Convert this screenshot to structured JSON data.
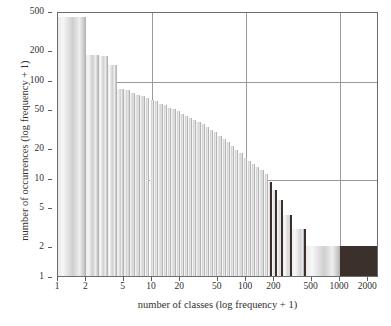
{
  "chart_data": {
    "type": "bar",
    "title": "",
    "subtitle": "",
    "xlabel": "number of classes (log frequency + 1)",
    "ylabel": "number of occurrences (log frequency + 1)",
    "xscale": "log",
    "yscale": "log",
    "xlim": [
      1,
      2600
    ],
    "ylim": [
      1,
      500
    ],
    "grid": true,
    "legend": null,
    "annotations": [],
    "x_ticks": [
      {
        "value": 1,
        "label": "1"
      },
      {
        "value": 2,
        "label": "2"
      },
      {
        "value": 5,
        "label": "5"
      },
      {
        "value": 10,
        "label": "10"
      },
      {
        "value": 20,
        "label": "20"
      },
      {
        "value": 50,
        "label": "50"
      },
      {
        "value": 100,
        "label": "100"
      },
      {
        "value": 200,
        "label": "200"
      },
      {
        "value": 500,
        "label": "500"
      },
      {
        "value": 1000,
        "label": "1000"
      },
      {
        "value": 2000,
        "label": "2000"
      }
    ],
    "y_ticks": [
      {
        "value": 1,
        "label": "1"
      },
      {
        "value": 2,
        "label": "2"
      },
      {
        "value": 5,
        "label": "5"
      },
      {
        "value": 10,
        "label": "10"
      },
      {
        "value": 20,
        "label": "20"
      },
      {
        "value": 50,
        "label": "50"
      },
      {
        "value": 100,
        "label": "100"
      },
      {
        "value": 200,
        "label": "200"
      },
      {
        "value": 500,
        "label": "500"
      }
    ],
    "gridlines": {
      "horizontal_values": [
        10,
        100
      ],
      "vertical_values": [
        10,
        100,
        1000
      ]
    },
    "colors": {
      "bar_light": "#dcdcdc",
      "bar_edge": "#b4b4b4",
      "bar_dark_edge": "#3a2f2b",
      "bar_solid": "#3b302b",
      "axis": "#6d6d6d",
      "grid": "#9a9a9a",
      "text": "#2f2f2f"
    },
    "bars": [
      {
        "x0": 1,
        "x1": 2,
        "value": 430,
        "style": "light"
      },
      {
        "x0": 2,
        "x1": 2.7,
        "value": 180,
        "style": "light"
      },
      {
        "x0": 2.7,
        "x1": 3.4,
        "value": 175,
        "style": "light"
      },
      {
        "x0": 3.4,
        "x1": 4.2,
        "value": 140,
        "style": "light"
      },
      {
        "x0": 4.2,
        "x1": 5,
        "value": 80,
        "style": "light"
      },
      {
        "x0": 5,
        "x1": 5.8,
        "value": 78,
        "style": "light"
      },
      {
        "x0": 5.8,
        "x1": 6.6,
        "value": 74,
        "style": "light"
      },
      {
        "x0": 6.6,
        "x1": 7.5,
        "value": 70,
        "style": "light"
      },
      {
        "x0": 7.5,
        "x1": 8.4,
        "value": 68,
        "style": "light"
      },
      {
        "x0": 8.4,
        "x1": 9.4,
        "value": 65,
        "style": "light"
      },
      {
        "x0": 9.4,
        "x1": 10.5,
        "value": 62,
        "style": "light"
      },
      {
        "x0": 10.5,
        "x1": 11.7,
        "value": 60,
        "style": "light"
      },
      {
        "x0": 11.7,
        "x1": 13,
        "value": 57,
        "style": "light"
      },
      {
        "x0": 13,
        "x1": 14.4,
        "value": 55,
        "style": "light"
      },
      {
        "x0": 14.4,
        "x1": 16,
        "value": 52,
        "style": "light"
      },
      {
        "x0": 16,
        "x1": 17.8,
        "value": 50,
        "style": "light"
      },
      {
        "x0": 17.8,
        "x1": 19.7,
        "value": 48,
        "style": "light"
      },
      {
        "x0": 19.7,
        "x1": 21.8,
        "value": 45,
        "style": "light"
      },
      {
        "x0": 21.8,
        "x1": 24.2,
        "value": 43,
        "style": "light"
      },
      {
        "x0": 24.2,
        "x1": 26.8,
        "value": 41,
        "style": "light"
      },
      {
        "x0": 26.8,
        "x1": 29.7,
        "value": 39,
        "style": "light"
      },
      {
        "x0": 29.7,
        "x1": 32.9,
        "value": 37,
        "style": "light"
      },
      {
        "x0": 32.9,
        "x1": 36.5,
        "value": 35,
        "style": "light"
      },
      {
        "x0": 36.5,
        "x1": 40.4,
        "value": 33,
        "style": "light"
      },
      {
        "x0": 40.4,
        "x1": 44.8,
        "value": 31,
        "style": "light"
      },
      {
        "x0": 44.8,
        "x1": 49.6,
        "value": 29,
        "style": "light"
      },
      {
        "x0": 49.6,
        "x1": 55,
        "value": 27,
        "style": "light"
      },
      {
        "x0": 55,
        "x1": 61,
        "value": 25,
        "style": "light"
      },
      {
        "x0": 61,
        "x1": 67.5,
        "value": 23,
        "style": "light"
      },
      {
        "x0": 67.5,
        "x1": 74.8,
        "value": 21,
        "style": "light"
      },
      {
        "x0": 74.8,
        "x1": 83,
        "value": 19,
        "style": "light"
      },
      {
        "x0": 83,
        "x1": 92,
        "value": 18,
        "style": "light"
      },
      {
        "x0": 92,
        "x1": 102,
        "value": 16,
        "style": "light"
      },
      {
        "x0": 102,
        "x1": 113,
        "value": 15,
        "style": "light"
      },
      {
        "x0": 113,
        "x1": 125,
        "value": 14,
        "style": "light"
      },
      {
        "x0": 125,
        "x1": 139,
        "value": 13,
        "style": "light"
      },
      {
        "x0": 139,
        "x1": 154,
        "value": 12,
        "style": "light"
      },
      {
        "x0": 154,
        "x1": 171,
        "value": 11,
        "style": "light"
      },
      {
        "x0": 171,
        "x1": 190,
        "value": 9,
        "style": "dark"
      },
      {
        "x0": 190,
        "x1": 215,
        "value": 7.5,
        "style": "dark"
      },
      {
        "x0": 215,
        "x1": 248,
        "value": 6,
        "style": "dark"
      },
      {
        "x0": 248,
        "x1": 310,
        "value": 4.2,
        "style": "dark"
      },
      {
        "x0": 310,
        "x1": 430,
        "value": 3,
        "style": "dark"
      },
      {
        "x0": 430,
        "x1": 1000,
        "value": 2,
        "style": "light"
      },
      {
        "x0": 1000,
        "x1": 2600,
        "value": 2,
        "style": "solid"
      }
    ]
  }
}
